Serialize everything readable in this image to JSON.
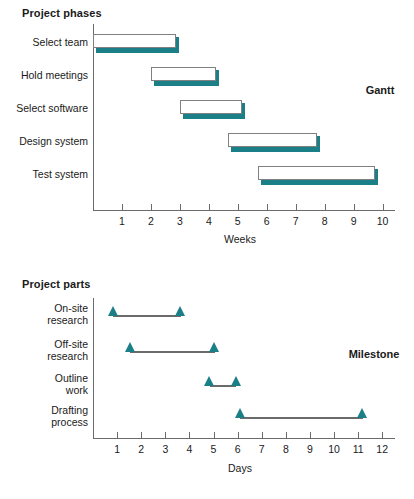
{
  "chart_data": [
    {
      "type": "bar",
      "variant": "gantt",
      "title": "Project phases",
      "corner_label": "Gantt",
      "xlabel": "Weeks",
      "ylabel": "",
      "xlim": [
        0,
        10.6
      ],
      "xticks": [
        1,
        2,
        3,
        4,
        5,
        6,
        7,
        8,
        9,
        10
      ],
      "xtick_labels": [
        "1",
        "2",
        "3",
        "4",
        "5",
        "6",
        "7",
        "8",
        "9",
        "10"
      ],
      "grid": false,
      "legend": "none",
      "categories": [
        "Select team",
        "Hold meetings",
        "Select software",
        "Design system",
        "Test system"
      ],
      "bars": [
        {
          "label": "Select team",
          "start": 0.0,
          "end": 2.85
        },
        {
          "label": "Hold meetings",
          "start": 2.0,
          "end": 4.25
        },
        {
          "label": "Select software",
          "start": 3.0,
          "end": 5.15
        },
        {
          "label": "Design system",
          "start": 4.65,
          "end": 7.75
        },
        {
          "label": "Test system",
          "start": 5.7,
          "end": 9.75
        }
      ],
      "bar_fill": "#ffffff",
      "bar_border": "#808080",
      "bar_shadow": "#1b7f88"
    },
    {
      "type": "line",
      "variant": "milestone",
      "title": "Project parts",
      "corner_label": "Milestone",
      "xlabel": "Days",
      "ylabel": "",
      "xlim": [
        0,
        12.8
      ],
      "xticks": [
        1,
        2,
        3,
        4,
        5,
        6,
        7,
        8,
        9,
        10,
        11,
        12
      ],
      "xtick_labels": [
        "1",
        "2",
        "3",
        "4",
        "5",
        "6",
        "7",
        "8",
        "9",
        "10",
        "11",
        "12"
      ],
      "grid": false,
      "legend": "none",
      "categories": [
        "On-site research",
        "Off-site research",
        "Outline work",
        "Drafting process"
      ],
      "tasks": [
        {
          "label_line1": "On-site",
          "label_line2": "research",
          "start": 0.85,
          "end": 3.65
        },
        {
          "label_line1": "Off-site",
          "label_line2": "research",
          "start": 1.55,
          "end": 5.05
        },
        {
          "label_line1": "Outline",
          "label_line2": "work",
          "start": 4.85,
          "end": 5.95
        },
        {
          "label_line1": "Drafting",
          "label_line2": "process",
          "start": 6.1,
          "end": 11.2
        }
      ],
      "marker_color": "#1b7f88",
      "line_color": "#6b6b6b"
    }
  ],
  "gantt": {
    "title": "Project phases",
    "corner_label": "Gantt",
    "xlabel": "Weeks",
    "rows": [
      {
        "label": "Select team"
      },
      {
        "label": "Hold meetings"
      },
      {
        "label": "Select software"
      },
      {
        "label": "Design system"
      },
      {
        "label": "Test system"
      }
    ],
    "xticks": [
      "1",
      "2",
      "3",
      "4",
      "5",
      "6",
      "7",
      "8",
      "9",
      "10"
    ]
  },
  "milestone": {
    "title": "Project parts",
    "corner_label": "Milestone",
    "xlabel": "Days",
    "rows": [
      {
        "line1": "On-site",
        "line2": "research"
      },
      {
        "line1": "Off-site",
        "line2": "research"
      },
      {
        "line1": "Outline",
        "line2": "work"
      },
      {
        "line1": "Drafting",
        "line2": "process"
      }
    ],
    "xticks": [
      "1",
      "2",
      "3",
      "4",
      "5",
      "6",
      "7",
      "8",
      "9",
      "10",
      "11",
      "12"
    ]
  },
  "colors": {
    "accent": "#1b7f88",
    "axis": "#6b6b6b",
    "bar_border": "#808080",
    "text": "#1a1a1a",
    "background": "#ffffff"
  }
}
